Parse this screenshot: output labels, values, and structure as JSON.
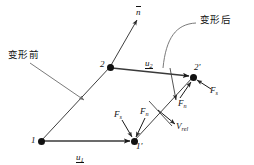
{
  "figure": {
    "colors": {
      "line": "#3f3f3f",
      "stroke": "#1a1a1a",
      "node": "#111111",
      "leader": "#6b6b6b"
    },
    "annotations": {
      "before_deformation": "变形前",
      "after_deformation": "变形后",
      "normal_vector": "n"
    },
    "nodes": [
      {
        "id": "node-1",
        "label": "1",
        "x": 41,
        "y": 141
      },
      {
        "id": "node-2",
        "label": "2",
        "x": 110,
        "y": 67
      },
      {
        "id": "node-1-prime",
        "label": "1'",
        "x": 134,
        "y": 141
      },
      {
        "id": "node-2-prime",
        "label": "2'",
        "x": 193,
        "y": 77
      }
    ],
    "displacements": [
      {
        "id": "u1",
        "base": "u",
        "subscript": "1"
      },
      {
        "id": "u2",
        "base": "u",
        "subscript": "2"
      }
    ],
    "forces": [
      {
        "id": "force-fs-node1p",
        "base": "F",
        "subscript": "s"
      },
      {
        "id": "force-fn-node1p",
        "base": "F",
        "subscript": "n"
      },
      {
        "id": "force-fn-node2p",
        "base": "F",
        "subscript": "n"
      },
      {
        "id": "force-fs-node2p",
        "base": "F",
        "subscript": "s"
      }
    ],
    "relative_velocity": {
      "base": "V",
      "subscript": "rel"
    }
  }
}
